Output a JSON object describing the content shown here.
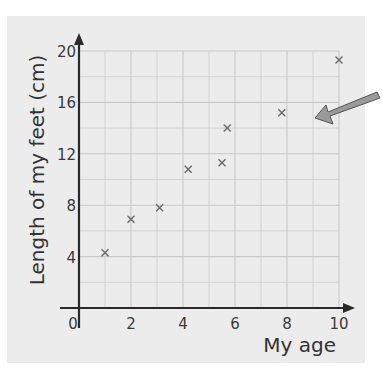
{
  "chart_data": {
    "type": "scatter",
    "title": "",
    "xlabel": "My age",
    "ylabel": "Length of my feet (cm)",
    "xlim": [
      0,
      10
    ],
    "ylim": [
      0,
      20
    ],
    "x_ticks": [
      "0",
      "2",
      "4",
      "6",
      "8",
      "10"
    ],
    "y_ticks": [
      "4",
      "8",
      "12",
      "16",
      "20"
    ],
    "grid": true,
    "marker": "x",
    "points": [
      {
        "x": 1.0,
        "y": 4.3
      },
      {
        "x": 2.0,
        "y": 6.9
      },
      {
        "x": 3.1,
        "y": 7.8
      },
      {
        "x": 4.2,
        "y": 10.8
      },
      {
        "x": 5.5,
        "y": 11.3
      },
      {
        "x": 5.7,
        "y": 14.0
      },
      {
        "x": 7.8,
        "y": 15.2
      },
      {
        "x": 10.0,
        "y": 19.3
      }
    ],
    "annotations": [
      {
        "type": "arrow",
        "description": "gray arrow pointing toward gap between x=8 and x=10 near y=15"
      }
    ]
  },
  "colors": {
    "panel_bg": "#ececec",
    "grid": "#c8c8c8",
    "axis": "#2a2a2a",
    "marker": "#6a6a6a",
    "arrow_fill": "#9a9a9a"
  }
}
